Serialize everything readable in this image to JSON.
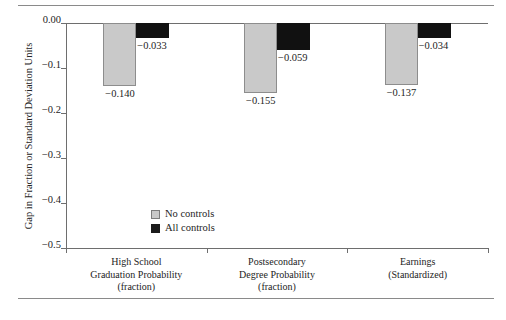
{
  "chart_data": {
    "type": "bar",
    "title": "",
    "xlabel": "",
    "ylabel": "Gap in Fraction or Standard Deviation Units",
    "ylim": [
      -0.5,
      0.0
    ],
    "yticks": [
      "0.00",
      "−0.1",
      "−0.2",
      "−0.3",
      "−0.4",
      "−0.5"
    ],
    "ytick_values": [
      0.0,
      -0.1,
      -0.2,
      -0.3,
      -0.4,
      -0.5
    ],
    "grid": false,
    "legend_position": "inside-left",
    "categories": [
      "High School Graduation Probability (fraction)",
      "Postsecondary Degree Probability (fraction)",
      "Earnings (Standardized)"
    ],
    "category_lines": [
      [
        "High School",
        "Graduation Probability",
        "(fraction)"
      ],
      [
        "Postsecondary",
        "Degree Probability",
        "(fraction)"
      ],
      [
        "Earnings",
        "(Standardized)"
      ]
    ],
    "series": [
      {
        "name": "No controls",
        "color": "#c9c9c9",
        "values": [
          -0.14,
          -0.155,
          -0.137
        ],
        "labels": [
          "−0.140",
          "−0.155",
          "−0.137"
        ]
      },
      {
        "name": "All controls",
        "color": "#111111",
        "values": [
          -0.033,
          -0.059,
          -0.034
        ],
        "labels": [
          "−0.033",
          "−0.059",
          "−0.034"
        ]
      }
    ]
  },
  "legend": {
    "items": [
      {
        "label": "No controls"
      },
      {
        "label": "All controls"
      }
    ]
  }
}
